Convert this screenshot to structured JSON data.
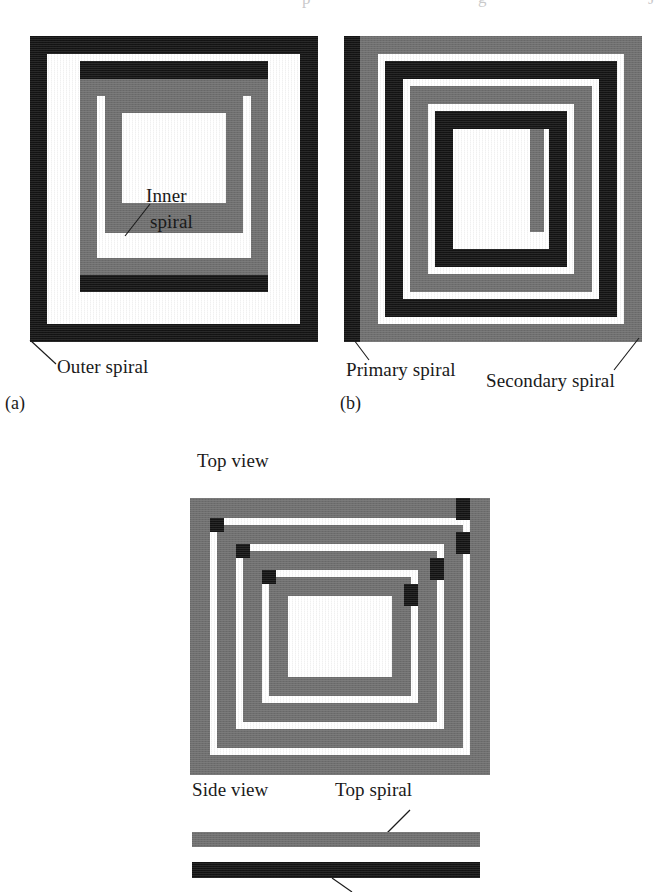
{
  "figure": {
    "type": "technical-diagram",
    "background_color": "#ffffff",
    "ink_black": "#141414",
    "ink_gray": "#6f6f6f",
    "paper_white": "#ffffff"
  },
  "scan_artifact": {
    "visible": true,
    "fragment_left": "p",
    "fragment_mid": "g",
    "fragment_right": "J"
  },
  "panel_a": {
    "letter": "(a)",
    "labels": {
      "inner_spiral_line1": "Inner",
      "inner_spiral_line2": "spiral",
      "outer_spiral": "Outer spiral"
    },
    "colors": {
      "outer": "#141414",
      "inner": "#6f6f6f",
      "gap": "#ffffff"
    },
    "rings": [
      {
        "name": "outer-turn-1",
        "color": "#141414"
      },
      {
        "name": "outer-turn-2",
        "color": "#141414"
      },
      {
        "name": "inner-turn-1",
        "color": "#6f6f6f"
      },
      {
        "name": "inner-turn-2",
        "color": "#6f6f6f"
      }
    ]
  },
  "panel_b": {
    "letter": "(b)",
    "labels": {
      "primary_spiral": "Primary spiral",
      "secondary_spiral": "Secondary spiral"
    },
    "colors": {
      "primary": "#141414",
      "secondary": "#6f6f6f",
      "gap": "#ffffff"
    },
    "rings": [
      {
        "name": "secondary-turn-1",
        "color": "#6f6f6f"
      },
      {
        "name": "primary-turn-1",
        "color": "#141414"
      },
      {
        "name": "secondary-turn-2",
        "color": "#6f6f6f"
      },
      {
        "name": "primary-turn-2",
        "color": "#141414"
      }
    ]
  },
  "panel_c": {
    "labels": {
      "top_view": "Top view",
      "side_view": "Side view",
      "top_spiral": "Top spiral"
    },
    "colors": {
      "spiral": "#6f6f6f",
      "via": "#141414",
      "bottom_spiral": "#141414",
      "gap": "#ffffff"
    },
    "side_view_bars": [
      {
        "name": "top-spiral-bar",
        "color": "#6f6f6f"
      },
      {
        "name": "bottom-spiral-bar",
        "color": "#141414"
      }
    ],
    "via_count": 8
  }
}
